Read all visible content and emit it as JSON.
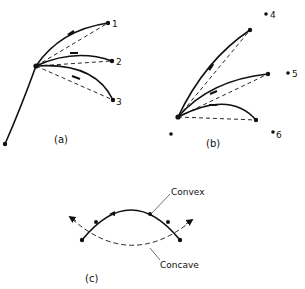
{
  "panels": {
    "a": {
      "label": "(a)",
      "points": [
        "1",
        "2",
        "3"
      ]
    },
    "b": {
      "label": "(b)",
      "points": [
        "4",
        "5",
        "6"
      ]
    },
    "c": {
      "label": "(c)",
      "convex_label": "Convex",
      "concave_label": "Concave"
    }
  },
  "colors": {
    "ink": "#111111",
    "background": "#ffffff"
  }
}
